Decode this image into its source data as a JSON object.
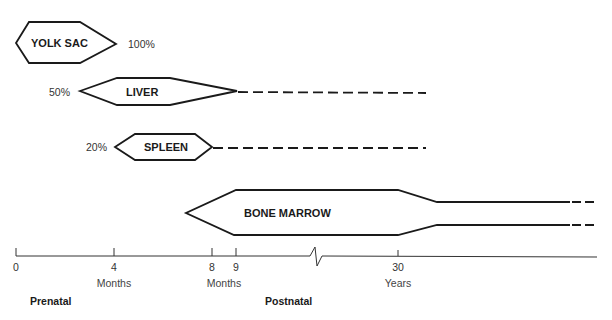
{
  "organs": [
    {
      "id": "yolk-sac",
      "label": "YOLK SAC",
      "percent_label": "100%",
      "percent_side": "right"
    },
    {
      "id": "liver",
      "label": "LIVER",
      "percent_label": "50%",
      "percent_side": "left",
      "continues_dashed": true
    },
    {
      "id": "spleen",
      "label": "SPLEEN",
      "percent_label": "20%",
      "percent_side": "left",
      "continues_dashed": true
    },
    {
      "id": "bone-marrow",
      "label": "BONE MARROW",
      "continues_dashed": true
    }
  ],
  "axis": {
    "ticks": [
      {
        "label": "0"
      },
      {
        "label": "4"
      },
      {
        "label": "8"
      },
      {
        "label": "9"
      },
      {
        "label": "30"
      }
    ],
    "units": [
      {
        "label": "Months"
      },
      {
        "label": "Months"
      },
      {
        "label": "Years"
      }
    ],
    "has_break": true
  },
  "phases": [
    {
      "label": "Prenatal"
    },
    {
      "label": "Postnatal"
    }
  ],
  "colors": {
    "stroke": "#1a1a1a",
    "background": "#ffffff"
  }
}
